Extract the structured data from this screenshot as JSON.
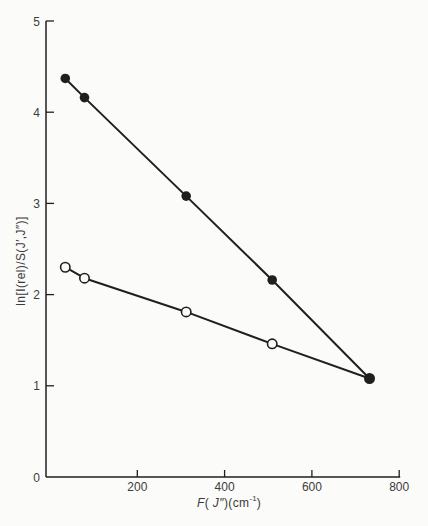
{
  "figure": {
    "background": "#fbfbf9",
    "ink": "#1f1f1f",
    "text_color": "#3c3c3c"
  },
  "chart_data": {
    "type": "line",
    "title": "",
    "xlabel": "F( J″)(cm⁻¹)",
    "xlabel_parts": {
      "f_var": "F",
      "open_paren": "( ",
      "j_var": "J″",
      "mid": ")(cm",
      "sup": "-1",
      "close_paren": ")"
    },
    "ylabel": "ln[I(rel)/S(J′,J″)]",
    "xlim": [
      0,
      800
    ],
    "ylim": [
      0,
      5
    ],
    "x_ticks": [
      200,
      400,
      600,
      800
    ],
    "y_ticks": [
      0,
      1,
      2,
      3,
      4,
      5
    ],
    "grid": false,
    "legend": "none",
    "x": [
      35,
      79,
      312,
      509,
      732
    ],
    "series": [
      {
        "name": "upper-filled-circles",
        "marker": "filled",
        "y": [
          4.37,
          4.16,
          3.08,
          2.16,
          1.08
        ]
      },
      {
        "name": "lower-open-circles",
        "marker": "open",
        "y": [
          2.3,
          2.18,
          1.81,
          1.46,
          1.08
        ]
      }
    ]
  }
}
